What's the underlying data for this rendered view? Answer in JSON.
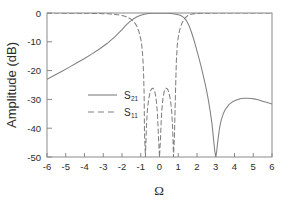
{
  "chart_data": {
    "type": "line",
    "title": "",
    "xlabel": "Ω",
    "ylabel": "Amplitude (dB)",
    "xlim": [
      -6,
      6
    ],
    "ylim": [
      -50,
      0
    ],
    "xticks": [
      -6,
      -5,
      -4,
      -3,
      -2,
      -1,
      0,
      1,
      2,
      3,
      4,
      5,
      6
    ],
    "xticklabels": [
      "-6",
      "-5",
      "-4",
      "-3",
      "-2",
      "-1",
      "0",
      "1",
      "2",
      "3",
      "4",
      "5",
      "6"
    ],
    "yticks": [
      0,
      -10,
      -20,
      -30,
      -40,
      -50
    ],
    "yticklabels": [
      "0",
      "-10",
      "-20",
      "-30",
      "-40",
      "-50"
    ],
    "grid": false,
    "legend_position": "center-left",
    "line_color": "#808080",
    "axis_color": "#8a8a8a",
    "text_color": "#2b2b2b",
    "series": [
      {
        "name": "S21",
        "legend_label": "S",
        "legend_sub": "21",
        "style": "solid",
        "x": [
          -6.0,
          -5.6,
          -5.2,
          -4.8,
          -4.4,
          -4.0,
          -3.6,
          -3.2,
          -2.8,
          -2.4,
          -2.0,
          -1.8,
          -1.6,
          -1.4,
          -1.2,
          -1.0,
          -0.8,
          -0.6,
          -0.4,
          -0.2,
          0.0,
          0.2,
          0.4,
          0.6,
          0.8,
          1.0,
          1.1,
          1.2,
          1.3,
          1.4,
          1.5,
          1.6,
          1.7,
          1.8,
          1.9,
          2.0,
          2.1,
          2.2,
          2.3,
          2.4,
          2.5,
          2.6,
          2.7,
          2.8,
          2.9,
          2.95,
          3.0,
          3.05,
          3.1,
          3.2,
          3.3,
          3.4,
          3.5,
          3.7,
          3.9,
          4.1,
          4.3,
          4.5,
          4.7,
          4.9,
          5.1,
          5.3,
          5.5,
          5.7,
          6.0
        ],
        "y": [
          -23.0,
          -21.6,
          -20.2,
          -18.8,
          -17.3,
          -15.8,
          -14.2,
          -12.5,
          -10.6,
          -8.4,
          -5.8,
          -4.3,
          -3.1,
          -2.1,
          -1.3,
          -0.75,
          -0.4,
          -0.2,
          -0.1,
          -0.04,
          -0.02,
          -0.04,
          -0.1,
          -0.2,
          -0.35,
          -0.6,
          -0.8,
          -1.1,
          -1.6,
          -2.3,
          -3.4,
          -4.8,
          -6.6,
          -8.6,
          -10.8,
          -13.2,
          -15.6,
          -18.1,
          -20.8,
          -23.6,
          -26.6,
          -30.0,
          -34.0,
          -38.5,
          -45.0,
          -48.0,
          -50.0,
          -48.0,
          -45.0,
          -40.0,
          -37.0,
          -35.0,
          -33.6,
          -31.8,
          -30.8,
          -30.2,
          -29.8,
          -29.6,
          -29.6,
          -29.7,
          -29.9,
          -30.2,
          -30.6,
          -31.0,
          -31.6
        ]
      },
      {
        "name": "S11",
        "legend_label": "S",
        "legend_sub": "11",
        "style": "dashed",
        "x": [
          -6.0,
          -5.5,
          -5.0,
          -4.5,
          -4.0,
          -3.5,
          -3.0,
          -2.6,
          -2.2,
          -2.0,
          -1.8,
          -1.6,
          -1.5,
          -1.4,
          -1.3,
          -1.2,
          -1.1,
          -1.0,
          -0.95,
          -0.9,
          -0.88,
          -0.85,
          -0.82,
          -0.8,
          -0.75,
          -0.7,
          -0.65,
          -0.6,
          -0.55,
          -0.5,
          -0.45,
          -0.4,
          -0.35,
          -0.3,
          -0.25,
          -0.2,
          -0.15,
          -0.1,
          -0.05,
          0.0,
          0.05,
          0.1,
          0.15,
          0.2,
          0.25,
          0.3,
          0.35,
          0.4,
          0.45,
          0.5,
          0.55,
          0.6,
          0.65,
          0.7,
          0.75,
          0.8,
          0.85,
          0.88,
          0.9,
          0.95,
          1.0,
          1.05,
          1.1,
          1.2,
          1.3,
          1.4,
          1.5,
          1.6,
          1.8,
          2.0,
          2.5,
          3.0,
          3.5,
          4.0,
          4.5,
          5.0,
          5.5,
          6.0
        ],
        "y": [
          -0.02,
          -0.03,
          -0.04,
          -0.06,
          -0.09,
          -0.14,
          -0.23,
          -0.36,
          -0.62,
          -0.85,
          -1.2,
          -1.8,
          -2.2,
          -2.8,
          -3.6,
          -4.7,
          -6.4,
          -9.0,
          -11.0,
          -14.5,
          -16.5,
          -21.0,
          -28.0,
          -42.0,
          -50.0,
          -40.0,
          -34.0,
          -31.0,
          -29.0,
          -27.6,
          -26.7,
          -26.2,
          -26.1,
          -26.5,
          -27.4,
          -29.0,
          -31.6,
          -36.0,
          -44.0,
          -50.0,
          -44.0,
          -36.0,
          -31.6,
          -29.0,
          -27.4,
          -26.5,
          -26.1,
          -26.2,
          -26.7,
          -27.6,
          -29.0,
          -31.0,
          -34.0,
          -40.0,
          -50.0,
          -42.0,
          -28.0,
          -21.0,
          -16.5,
          -11.0,
          -8.4,
          -6.6,
          -5.3,
          -3.5,
          -2.3,
          -1.5,
          -0.95,
          -0.6,
          -0.3,
          -0.16,
          -0.06,
          -0.03,
          -0.02,
          -0.015,
          -0.012,
          -0.01,
          -0.008,
          -0.006
        ]
      }
    ],
    "annotations": {
      "transmission_zero": 3.0,
      "passband_edges": [
        -0.9,
        0.9
      ]
    }
  }
}
